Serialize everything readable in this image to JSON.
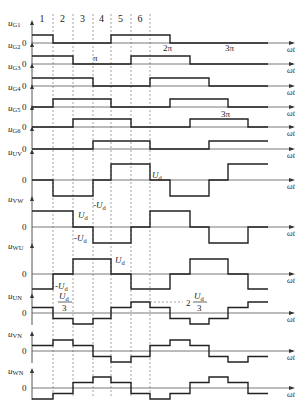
{
  "sectors": [
    "1",
    "2",
    "3",
    "4",
    "5",
    "6"
  ],
  "x_axis_label": "ωt",
  "pi_labels": {
    "pi": "π",
    "two_pi": "2π",
    "three_pi": "3π"
  },
  "zero_label": "0",
  "rows": [
    {
      "id": "uG1",
      "name": "u",
      "sub": "G1",
      "type": "gate",
      "levels": [
        1,
        0,
        0,
        0,
        1,
        1,
        1,
        0,
        0,
        0,
        0,
        0
      ]
    },
    {
      "id": "uG2",
      "name": "u",
      "sub": "G2",
      "type": "gate",
      "levels": [
        1,
        1,
        0,
        0,
        0,
        1,
        1,
        1,
        0,
        0,
        0,
        0
      ]
    },
    {
      "id": "uG3",
      "name": "u",
      "sub": "G3",
      "type": "gate",
      "levels": [
        1,
        1,
        1,
        0,
        0,
        0,
        1,
        1,
        1,
        0,
        0,
        0
      ]
    },
    {
      "id": "uG4",
      "name": "u",
      "sub": "G4",
      "type": "gate",
      "levels": [
        0,
        1,
        1,
        1,
        0,
        0,
        0,
        1,
        1,
        1,
        0,
        0
      ]
    },
    {
      "id": "uG5",
      "name": "u",
      "sub": "G5",
      "type": "gate",
      "levels": [
        0,
        0,
        1,
        1,
        1,
        0,
        0,
        0,
        1,
        1,
        1,
        0
      ]
    },
    {
      "id": "uG6",
      "name": "u",
      "sub": "G6",
      "type": "gate",
      "levels": [
        0,
        0,
        0,
        1,
        1,
        1,
        0,
        0,
        0,
        1,
        1,
        1
      ]
    },
    {
      "id": "uUV",
      "name": "u",
      "sub": "UV",
      "type": "line",
      "levels": [
        0,
        -1,
        -1,
        0,
        1,
        1,
        0,
        -1,
        -1,
        0,
        1,
        1
      ]
    },
    {
      "id": "uVW",
      "name": "u",
      "sub": "VW",
      "type": "line",
      "levels": [
        1,
        1,
        0,
        -1,
        -1,
        0,
        1,
        1,
        0,
        -1,
        -1,
        0
      ]
    },
    {
      "id": "uWU",
      "name": "u",
      "sub": "WU",
      "type": "line",
      "levels": [
        -1,
        0,
        1,
        1,
        0,
        -1,
        -1,
        0,
        1,
        1,
        0,
        -1
      ]
    },
    {
      "id": "uUN",
      "name": "u",
      "sub": "UN",
      "type": "phase",
      "levels": [
        1,
        -1,
        -2,
        -1,
        1,
        2,
        1,
        -1,
        -2,
        -1,
        1,
        2
      ]
    },
    {
      "id": "uVN",
      "name": "u",
      "sub": "VN",
      "type": "phase",
      "levels": [
        1,
        2,
        1,
        -1,
        -2,
        -1,
        1,
        2,
        1,
        -1,
        -2,
        -1
      ]
    },
    {
      "id": "uWN",
      "name": "u",
      "sub": "WN",
      "type": "phase",
      "levels": [
        -2,
        -1,
        1,
        2,
        1,
        -1,
        -2,
        -1,
        1,
        2,
        1,
        -1
      ]
    }
  ],
  "annotations": {
    "Ud": "U",
    "Ud_sub": "d",
    "neg_Ud": "-U",
    "Ud_over_3_num": "U",
    "Ud_over_3_den": "3",
    "two": "2"
  }
}
